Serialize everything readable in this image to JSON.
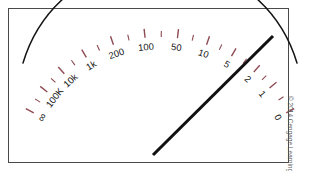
{
  "device": {
    "name": "analog-ohmmeter",
    "title": "Analog ohmmeter scale",
    "frame_color": "#4a4a4a",
    "background_color": "#ffffff"
  },
  "scale": {
    "name": "ohms-scale",
    "units": "ohms",
    "direction": "right-to-left-increasing",
    "arc_color": "#141414",
    "tick_color": "#8d4a52",
    "major_ticks": [
      {
        "label": "∞",
        "value": "infinity",
        "angle": -62
      },
      {
        "label": "100K",
        "value": "100000",
        "angle": -52
      },
      {
        "label": "10k",
        "value": "10000",
        "angle": -42
      },
      {
        "label": "1k",
        "value": "1000",
        "angle": -31
      },
      {
        "label": "200",
        "value": "200",
        "angle": -19
      },
      {
        "label": "100",
        "value": "100",
        "angle": -6
      },
      {
        "label": "50",
        "value": "50",
        "angle": 7
      },
      {
        "label": "10",
        "value": "10",
        "angle": 19
      },
      {
        "label": "5",
        "value": "5",
        "angle": 30
      },
      {
        "label": "2",
        "value": "2",
        "angle": 41
      },
      {
        "label": "1",
        "value": "1",
        "angle": 50
      },
      {
        "label": "0",
        "value": "0",
        "angle": 62
      }
    ],
    "minor_tick_angles": [
      -57,
      -47,
      -36.5,
      -25,
      -12.5,
      0.5,
      13,
      24.5,
      35.5,
      45.5,
      56
    ]
  },
  "needle": {
    "name": "meter-needle",
    "color": "#111111",
    "pivot_x": 153,
    "pivot_y": 155,
    "tip_x": 273,
    "tip_y": 36,
    "reading_between": [
      "1",
      "2"
    ],
    "reading_label": "1"
  },
  "credit": {
    "text": "© 2014 Cengage Learning"
  }
}
